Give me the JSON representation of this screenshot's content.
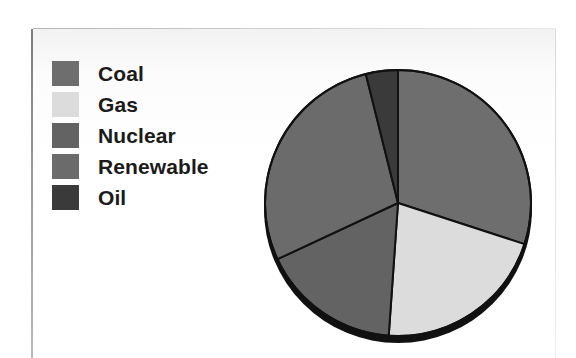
{
  "figure": {
    "type": "pie-chart-figure",
    "background": "#ffffff"
  },
  "legend": {
    "position": "left",
    "items": [
      {
        "label": "Coal",
        "color": "#6e6e6e",
        "swatch_name": "legend-swatch-coal"
      },
      {
        "label": "Gas",
        "color": "#dcdcdc",
        "swatch_name": "legend-swatch-gas"
      },
      {
        "label": "Nuclear",
        "color": "#636363",
        "swatch_name": "legend-swatch-nuclear"
      },
      {
        "label": "Renewable",
        "color": "#6b6b6b",
        "swatch_name": "legend-swatch-renewable"
      },
      {
        "label": "Oil",
        "color": "#3a3a3a",
        "swatch_name": "legend-swatch-oil"
      }
    ]
  },
  "chart_data": {
    "type": "pie",
    "title": "",
    "subtitle": "",
    "xlabel": "",
    "ylabel": "",
    "grid": false,
    "legend_position": "left",
    "start_angle_deg": 0,
    "direction": "clockwise",
    "categories": [
      "Coal",
      "Gas",
      "Nuclear",
      "Renewable",
      "Oil"
    ],
    "values": [
      30,
      21,
      17,
      28,
      4
    ],
    "unit": "percent",
    "colors": [
      "#6e6e6e",
      "#dcdcdc",
      "#636363",
      "#6b6b6b",
      "#3a3a3a"
    ],
    "slices": [
      {
        "label": "Coal",
        "value": 30,
        "color": "#6e6e6e",
        "start_deg": 0,
        "end_deg": 108
      },
      {
        "label": "Gas",
        "value": 21,
        "color": "#dcdcdc",
        "start_deg": 108,
        "end_deg": 184
      },
      {
        "label": "Nuclear",
        "value": 17,
        "color": "#636363",
        "start_deg": 184,
        "end_deg": 245
      },
      {
        "label": "Renewable",
        "value": 28,
        "color": "#6b6b6b",
        "start_deg": 245,
        "end_deg": 346
      },
      {
        "label": "Oil",
        "value": 4,
        "color": "#3a3a3a",
        "start_deg": 346,
        "end_deg": 360
      }
    ],
    "style": {
      "slice_border_color": "#111111",
      "slice_border_width": 2,
      "shadow_color": "#111111",
      "has_drop_shadow": true,
      "center_x": 146,
      "center_y": 153,
      "radius": 133
    }
  }
}
